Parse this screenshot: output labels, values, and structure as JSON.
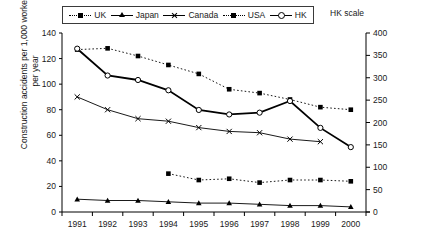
{
  "legend": {
    "items": [
      {
        "label": "UK",
        "icon": "dotted-square-marker-icon"
      },
      {
        "label": "Japan",
        "icon": "solid-triangle-marker-icon"
      },
      {
        "label": "Canada",
        "icon": "solid-cross-marker-icon"
      },
      {
        "label": "USA",
        "icon": "dotted-square-marker-icon"
      },
      {
        "label": "HK",
        "icon": "solid-open-circle-marker-icon"
      }
    ],
    "secondary_axis_note": "HK scale"
  },
  "chart_data": {
    "type": "line",
    "title": "",
    "xlabel": "",
    "ylabel": "Construction accidents per 1,000 workers per year",
    "y2label": "HK scale",
    "categories": [
      "1991",
      "1992",
      "1993",
      "1994",
      "1995",
      "1996",
      "1997",
      "1998",
      "1999",
      "2000"
    ],
    "ylim": [
      0,
      140
    ],
    "yticks": [
      0,
      20,
      40,
      60,
      80,
      100,
      120,
      140
    ],
    "y2lim": [
      0,
      400
    ],
    "y2ticks": [
      0,
      50,
      100,
      150,
      200,
      250,
      300,
      350,
      400
    ],
    "grid": false,
    "legend_position": "top",
    "series": [
      {
        "name": "UK",
        "axis": "left",
        "style": "dotted",
        "marker": "square",
        "x": [
          "1994",
          "1995",
          "1996",
          "1997",
          "1998",
          "1999",
          "2000"
        ],
        "values": [
          30,
          25,
          26,
          23,
          25,
          25,
          24
        ]
      },
      {
        "name": "Japan",
        "axis": "left",
        "style": "solid",
        "marker": "triangle",
        "x": [
          "1991",
          "1992",
          "1993",
          "1994",
          "1995",
          "1996",
          "1997",
          "1998",
          "1999",
          "2000"
        ],
        "values": [
          10,
          9,
          9,
          8,
          7,
          7,
          6,
          5,
          5,
          4
        ]
      },
      {
        "name": "Canada",
        "axis": "left",
        "style": "solid",
        "marker": "cross",
        "x": [
          "1991",
          "1992",
          "1993",
          "1994",
          "1995",
          "1996",
          "1997",
          "1998",
          "1999"
        ],
        "values": [
          90,
          80,
          73,
          71,
          66,
          63,
          62,
          57,
          55
        ]
      },
      {
        "name": "USA",
        "axis": "left",
        "style": "dotted",
        "marker": "square",
        "x": [
          "1991",
          "1992",
          "1993",
          "1994",
          "1995",
          "1996",
          "1997",
          "1998",
          "1999",
          "2000"
        ],
        "values": [
          127,
          128,
          122,
          115,
          108,
          96,
          93,
          88,
          82,
          80
        ]
      },
      {
        "name": "HK",
        "axis": "right",
        "style": "solid-bold",
        "marker": "open-circle",
        "x": [
          "1991",
          "1992",
          "1993",
          "1994",
          "1995",
          "1996",
          "1997",
          "1998",
          "1999",
          "2000"
        ],
        "values": [
          365,
          305,
          295,
          272,
          228,
          218,
          222,
          248,
          188,
          145
        ],
        "values_left_equivalent": [
          128,
          107,
          103,
          95,
          80,
          76,
          78,
          87,
          66,
          51
        ]
      }
    ]
  }
}
